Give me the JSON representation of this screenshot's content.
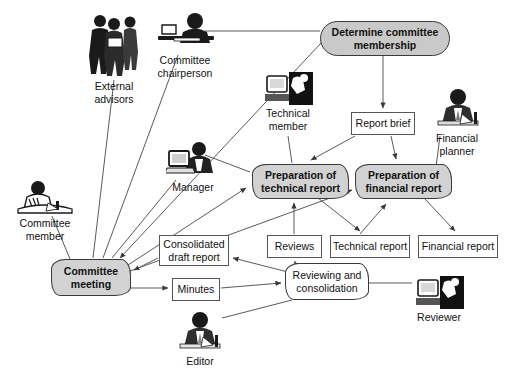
{
  "diagram": {
    "style": {
      "process_fill": "#c9c9c9",
      "activity_fill": "#d2d2d2",
      "data_fill": "#ffffff",
      "line_color": "#555555",
      "text_color": "#111111"
    },
    "nodes": [
      {
        "id": "determine",
        "label": "Determine committee membership",
        "shape": "stadium",
        "x": 320,
        "y": 21,
        "w": 130,
        "h": 35
      },
      {
        "id": "report_brief",
        "label": "Report brief",
        "shape": "rect",
        "x": 351,
        "y": 112,
        "w": 64,
        "h": 23
      },
      {
        "id": "prep_tech",
        "label": "Preparation of technical report",
        "shape": "cloud",
        "x": 252,
        "y": 164,
        "w": 97,
        "h": 35
      },
      {
        "id": "prep_fin",
        "label": "Preparation of financial report",
        "shape": "cloud",
        "x": 355,
        "y": 164,
        "w": 97,
        "h": 35
      },
      {
        "id": "consolidated",
        "label": "Consolidated draft report",
        "shape": "rect",
        "x": 159,
        "y": 235,
        "w": 70,
        "h": 31
      },
      {
        "id": "reviews",
        "label": "Reviews",
        "shape": "rect",
        "x": 267,
        "y": 235,
        "w": 55,
        "h": 23
      },
      {
        "id": "tech_report",
        "label": "Technical report",
        "shape": "rect",
        "x": 330,
        "y": 235,
        "w": 80,
        "h": 23
      },
      {
        "id": "fin_report",
        "label": "Financial report",
        "shape": "rect",
        "x": 418,
        "y": 235,
        "w": 80,
        "h": 23
      },
      {
        "id": "committee_meeting",
        "label": "Committee meeting",
        "shape": "cloud",
        "x": 51,
        "y": 259,
        "w": 80,
        "h": 37
      },
      {
        "id": "minutes",
        "label": "Minutes",
        "shape": "rect",
        "x": 172,
        "y": 278,
        "w": 48,
        "h": 23
      },
      {
        "id": "reviewing",
        "label": "Reviewing and consolidation",
        "shape": "cloud-plain",
        "x": 285,
        "y": 263,
        "w": 84,
        "h": 37
      }
    ],
    "actors": [
      {
        "id": "external_advisors",
        "label": "External advisors",
        "icon": "three-people-icon",
        "x": 82,
        "y": 10,
        "w": 64,
        "h": 68
      },
      {
        "id": "committee_chairperson",
        "label": "Committee chairperson",
        "icon": "person-at-desk-icon",
        "x": 152,
        "y": 12,
        "w": 66,
        "h": 40
      },
      {
        "id": "technical_member",
        "label": "Technical member",
        "icon": "person-computer-icon",
        "x": 263,
        "y": 72,
        "w": 50,
        "h": 33
      },
      {
        "id": "financial_planner",
        "label": "Financial planner",
        "icon": "person-writing-icon",
        "x": 432,
        "y": 88,
        "w": 50,
        "h": 42
      },
      {
        "id": "manager",
        "label": "Manager",
        "icon": "person-laptop-icon",
        "x": 166,
        "y": 141,
        "w": 54,
        "h": 38
      },
      {
        "id": "committee_member",
        "label": "Committee member",
        "icon": "person-reading-icon",
        "x": 12,
        "y": 181,
        "w": 66,
        "h": 34
      },
      {
        "id": "editor",
        "label": "Editor",
        "icon": "person-desk-papers-icon",
        "x": 176,
        "y": 311,
        "w": 48,
        "h": 42
      },
      {
        "id": "reviewer",
        "label": "Reviewer",
        "icon": "person-computer-icon",
        "x": 414,
        "y": 276,
        "w": 50,
        "h": 33
      }
    ],
    "edges": [
      {
        "from": "committee_chairperson",
        "to": "determine",
        "arrow": false
      },
      {
        "from": "determine",
        "to": "report_brief",
        "arrow": true
      },
      {
        "from": "determine",
        "to": "committee_meeting",
        "arrow": true
      },
      {
        "from": "report_brief",
        "to": "prep_tech",
        "arrow": true
      },
      {
        "from": "report_brief",
        "to": "prep_fin",
        "arrow": true
      },
      {
        "from": "technical_member",
        "to": "prep_tech",
        "arrow": false
      },
      {
        "from": "financial_planner",
        "to": "prep_fin",
        "arrow": false
      },
      {
        "from": "manager",
        "to": "prep_tech",
        "arrow": false
      },
      {
        "from": "external_advisors",
        "to": "committee_meeting",
        "arrow": false
      },
      {
        "from": "committee_member",
        "to": "committee_meeting",
        "arrow": false
      },
      {
        "from": "manager",
        "to": "committee_meeting",
        "arrow": false
      },
      {
        "from": "committee_meeting",
        "to": "prep_tech",
        "arrow": true
      },
      {
        "from": "committee_meeting",
        "to": "prep_fin",
        "arrow": true
      },
      {
        "from": "committee_meeting",
        "to": "minutes",
        "arrow": true
      },
      {
        "from": "consolidated",
        "to": "committee_meeting",
        "arrow": true
      },
      {
        "from": "prep_tech",
        "to": "tech_report",
        "arrow": true
      },
      {
        "from": "prep_fin",
        "to": "fin_report",
        "arrow": true
      },
      {
        "from": "reviews",
        "to": "prep_tech",
        "arrow": true
      },
      {
        "from": "tech_report",
        "to": "prep_fin",
        "arrow": true
      },
      {
        "from": "reviewing",
        "to": "reviews",
        "arrow": true
      },
      {
        "from": "reviewing",
        "to": "consolidated",
        "arrow": true
      },
      {
        "from": "minutes",
        "to": "reviewing",
        "arrow": true
      },
      {
        "from": "editor",
        "to": "reviewing",
        "arrow": false
      },
      {
        "from": "reviewer",
        "to": "reviewing",
        "arrow": false
      }
    ]
  }
}
